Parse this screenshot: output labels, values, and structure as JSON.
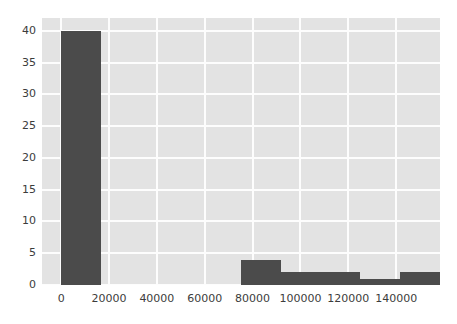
{
  "chart_data": {
    "type": "bar",
    "title": "",
    "xlabel": "",
    "ylabel": "",
    "grid": true,
    "legend": false,
    "xlim": [
      -8000,
      158300
    ],
    "ylim": [
      0,
      42
    ],
    "xticks": [
      0,
      20000,
      40000,
      60000,
      80000,
      100000,
      120000,
      140000
    ],
    "xtick_labels": [
      "0",
      "20000",
      "40000",
      "60000",
      "80000",
      "100000",
      "120000",
      "140000"
    ],
    "yticks": [
      0,
      5,
      10,
      15,
      20,
      25,
      30,
      35,
      40
    ],
    "ytick_labels": [
      "0",
      "5",
      "10",
      "15",
      "20",
      "25",
      "30",
      "35",
      "40"
    ],
    "bin_edges": [
      0,
      16700,
      33300,
      50000,
      66700,
      83300,
      100000,
      116700,
      133300,
      150000
    ],
    "bars": [
      {
        "x0": 0,
        "x1": 16700,
        "value": 40
      },
      {
        "x0": 75000,
        "x1": 91700,
        "value": 4
      },
      {
        "x0": 91700,
        "x1": 108300,
        "value": 2
      },
      {
        "x0": 108300,
        "x1": 125000,
        "value": 2
      },
      {
        "x0": 125000,
        "x1": 141700,
        "value": 1
      },
      {
        "x0": 141700,
        "x1": 158300,
        "value": 2
      }
    ],
    "values": [
      40,
      0,
      0,
      0,
      4,
      2,
      2,
      1,
      2
    ],
    "colors": {
      "bar": "#4b4b4b",
      "plot_background": "#e3e3e3",
      "gridline": "#fdfdfd",
      "figure_background": "#ffffff",
      "tick_text": "#3c3c3c"
    }
  }
}
